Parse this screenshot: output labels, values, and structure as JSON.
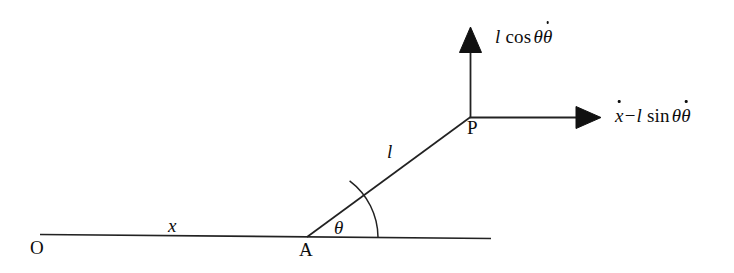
{
  "figure": {
    "kind": "mechanics-velocity-diagram",
    "background_color": "#ffffff",
    "stroke_color": "#111111",
    "labels": {
      "origin": "O",
      "pivot": "A",
      "particle": "P",
      "displacement": "x",
      "rod_length": "l",
      "angle": "θ"
    },
    "vectors": {
      "vertical": {
        "direction": "up",
        "label_parts": {
          "length": "l",
          "function": "cos",
          "angle": "θ",
          "rate": "θ",
          "rate_dot": "˙"
        },
        "label_plain": "l cos θθ̇"
      },
      "horizontal": {
        "direction": "right",
        "label_parts": {
          "first_term": "x",
          "first_term_dot": "˙",
          "operator": "−",
          "length": "l",
          "function": "sin",
          "angle": "θ",
          "rate": "θ",
          "rate_dot": "˙"
        },
        "label_plain": "ẋ − l sin θθ̇"
      }
    },
    "geometry": {
      "ground_line": {
        "x1": 40,
        "y1": 234.5,
        "x2": 491,
        "y2": 238.5
      },
      "rod": {
        "x1": 307,
        "y1": 237,
        "x2": 470,
        "y2": 117
      },
      "vertical_arrow": {
        "x": 470,
        "y_tail": 117,
        "y_tip": 28
      },
      "horizontal_arrow": {
        "y": 117,
        "x_tail": 470,
        "x_tip": 601
      },
      "angle_arc": {
        "cx": 307,
        "cy": 237,
        "radius": 71,
        "start_deg": 0,
        "end_deg": 36
      }
    }
  }
}
